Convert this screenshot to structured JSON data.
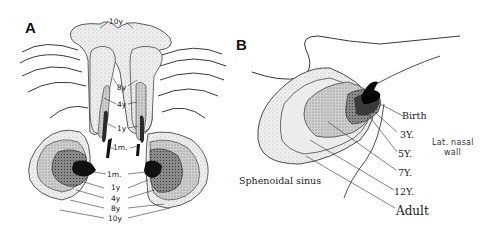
{
  "figure": {
    "panels": [
      {
        "id": "A",
        "letter": "A",
        "view": "coronal / frontal view of paired sinuses",
        "labels_upper": {
          "top": "10y",
          "l8": "8y",
          "l4": "4y",
          "l1": "1y",
          "l1m": "1m."
        },
        "labels_lower": [
          "1m.",
          "1y",
          "4y",
          "8y",
          "10y"
        ]
      },
      {
        "id": "B",
        "letter": "B",
        "view": "lateral view of sphenoidal sinus growth",
        "stages": [
          "Birth",
          "3Y.",
          "5Y.",
          "7Y.",
          "12Y.",
          "Adult"
        ],
        "structure_labels": {
          "sinus": "Sphenoidal sinus",
          "wall_line1": "Lat. nasal",
          "wall_line2": "wall"
        }
      }
    ],
    "colors": {
      "ink": "#1a1a1a",
      "fill_lightest": "#f2f2f2",
      "fill_light": "#dedede",
      "fill_mid": "#b8b8b8",
      "fill_dark": "#6e6e6e",
      "fill_darkest": "#111111"
    }
  }
}
